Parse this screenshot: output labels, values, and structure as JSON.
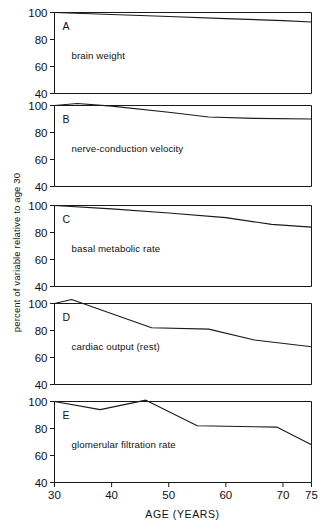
{
  "chart_data": {
    "type": "line",
    "title": "",
    "xlabel": "AGE (YEARS)",
    "ylabel": "percent of variable relative to age 30",
    "xlim": [
      30,
      75
    ],
    "ylim": [
      40,
      100
    ],
    "xticks": [
      30,
      40,
      50,
      60,
      70,
      75
    ],
    "yticks": [
      40,
      60,
      80,
      100
    ],
    "grid": false,
    "legend": "none",
    "panel_layout": "5 stacked panels sharing one x-axis",
    "panels": [
      {
        "letter": "A",
        "label": "brain weight",
        "x": [
          30,
          40,
          50,
          60,
          70,
          75
        ],
        "values": [
          100,
          98.5,
          97,
          95.5,
          94,
          93
        ]
      },
      {
        "letter": "B",
        "label": "nerve-conduction velocity",
        "x": [
          30,
          34,
          40,
          50,
          57,
          65,
          75
        ],
        "values": [
          100,
          101.5,
          99.5,
          95,
          91.5,
          90.5,
          90
        ]
      },
      {
        "letter": "C",
        "label": "basal metabolic rate",
        "x": [
          30,
          40,
          50,
          60,
          68,
          75
        ],
        "values": [
          100,
          97.5,
          94.5,
          91,
          86,
          84
        ]
      },
      {
        "letter": "D",
        "label": "cardiac output (rest)",
        "x": [
          30,
          33,
          47,
          57,
          65,
          75
        ],
        "values": [
          100,
          103,
          82,
          81,
          73,
          68
        ]
      },
      {
        "letter": "E",
        "label": "glomerular filtration rate",
        "x": [
          30,
          38,
          46,
          55,
          69,
          75
        ],
        "values": [
          100,
          94,
          101,
          82,
          81,
          68
        ]
      }
    ]
  },
  "axis": {
    "ytick_labels": [
      "100",
      "80",
      "60",
      "40"
    ],
    "xtick_labels": [
      "30",
      "40",
      "50",
      "60",
      "70",
      "75"
    ],
    "x_axis_title": "AGE (YEARS)",
    "y_axis_title": "percent of variable relative to age 30"
  },
  "colors": {
    "curve": "#1a1a1a",
    "axis": "#1a1a1a",
    "background": "#ffffff"
  }
}
